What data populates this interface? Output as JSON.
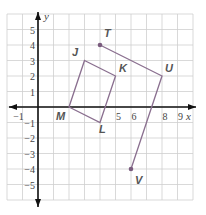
{
  "graph": {
    "x_axis_label": "x",
    "y_axis_label": "y",
    "x_ticks": [
      {
        "value": -1,
        "label": "−1"
      },
      {
        "value": 5,
        "label": "5"
      },
      {
        "value": 6,
        "label": "6"
      },
      {
        "value": 8,
        "label": "8"
      },
      {
        "value": 9,
        "label": "9"
      }
    ],
    "y_ticks": [
      {
        "value": 5,
        "label": "5"
      },
      {
        "value": 4,
        "label": "4"
      },
      {
        "value": 3,
        "label": "3"
      },
      {
        "value": 2,
        "label": "2"
      },
      {
        "value": 1,
        "label": "1"
      },
      {
        "value": -1,
        "label": "−1"
      },
      {
        "value": -2,
        "label": "−2"
      },
      {
        "value": -3,
        "label": "−3"
      },
      {
        "value": -4,
        "label": "−4"
      },
      {
        "value": -5,
        "label": "−5"
      }
    ],
    "x_range": [
      -2,
      10
    ],
    "y_range": [
      -6,
      6
    ],
    "grid": true,
    "line_color": "#8a6f8f",
    "point_color": "#7a5c7e"
  },
  "points": {
    "J": {
      "label": "J",
      "x": 3,
      "y": 3
    },
    "K": {
      "label": "K",
      "x": 5,
      "y": 2
    },
    "L": {
      "label": "L",
      "x": 4,
      "y": -1
    },
    "M": {
      "label": "M",
      "x": 2,
      "y": 0
    },
    "T": {
      "label": "T",
      "x": 4,
      "y": 4
    },
    "U": {
      "label": "U",
      "x": 8,
      "y": 2
    },
    "V": {
      "label": "V",
      "x": 6,
      "y": -4
    }
  },
  "shapes": {
    "quadrilateral": "JKLM",
    "path": "TUV"
  }
}
